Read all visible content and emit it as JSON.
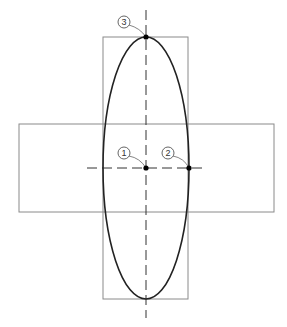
{
  "diagram": {
    "type": "ellipse-construction",
    "colors": {
      "frame": "#8a8a8a",
      "ellipse": "#222222",
      "centerline": "#333333",
      "point": "#000000"
    },
    "points": [
      {
        "id": "1",
        "label": "1",
        "x": 146,
        "y": 168,
        "lx": 124,
        "ly": 153
      },
      {
        "id": "2",
        "label": "2",
        "x": 189,
        "y": 168,
        "lx": 168,
        "ly": 153
      },
      {
        "id": "3",
        "label": "3",
        "x": 146,
        "y": 37,
        "lx": 124,
        "ly": 22
      }
    ]
  }
}
